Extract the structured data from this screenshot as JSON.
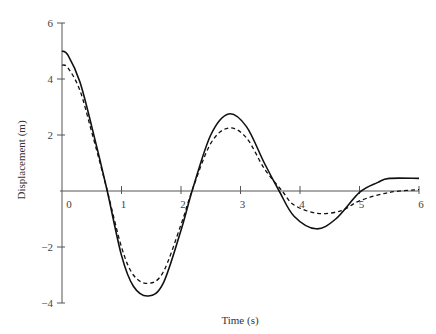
{
  "chart_data": {
    "type": "line",
    "title": "",
    "xlabel": "Time (s)",
    "ylabel": "Displacement (m)",
    "xlim": [
      0,
      6
    ],
    "ylim": [
      -4,
      6
    ],
    "xticks": [
      "0",
      "1",
      "2",
      "3",
      "4",
      "5",
      "6"
    ],
    "yticks": [
      "6",
      "4",
      "2",
      "−2",
      "−4"
    ],
    "grid": false,
    "legend": null,
    "series": [
      {
        "name": "solid",
        "style": "solid",
        "x": [
          0,
          0.1,
          0.3,
          0.5,
          0.75,
          1.0,
          1.2,
          1.45,
          1.7,
          2.0,
          2.2,
          2.5,
          2.8,
          3.1,
          3.4,
          3.65,
          3.9,
          4.27,
          4.6,
          5.0,
          5.3,
          5.5,
          6.0
        ],
        "y": [
          5.0,
          4.85,
          3.9,
          2.3,
          0.1,
          -2.3,
          -3.4,
          -3.75,
          -3.3,
          -1.4,
          0.1,
          2.0,
          2.75,
          2.3,
          1.0,
          0.0,
          -0.9,
          -1.35,
          -1.0,
          -0.05,
          0.3,
          0.45,
          0.45
        ]
      },
      {
        "name": "dashed",
        "style": "dashed",
        "x": [
          0,
          0.1,
          0.3,
          0.5,
          0.75,
          1.0,
          1.2,
          1.45,
          1.7,
          2.0,
          2.2,
          2.5,
          2.8,
          3.1,
          3.4,
          3.7,
          3.9,
          4.3,
          4.7,
          5.0,
          5.5,
          6.0
        ],
        "y": [
          4.5,
          4.4,
          3.6,
          2.1,
          0.1,
          -2.0,
          -3.0,
          -3.3,
          -2.9,
          -1.2,
          0.1,
          1.7,
          2.25,
          1.9,
          0.8,
          0.0,
          -0.5,
          -0.8,
          -0.7,
          -0.35,
          -0.05,
          0.05
        ]
      }
    ]
  }
}
